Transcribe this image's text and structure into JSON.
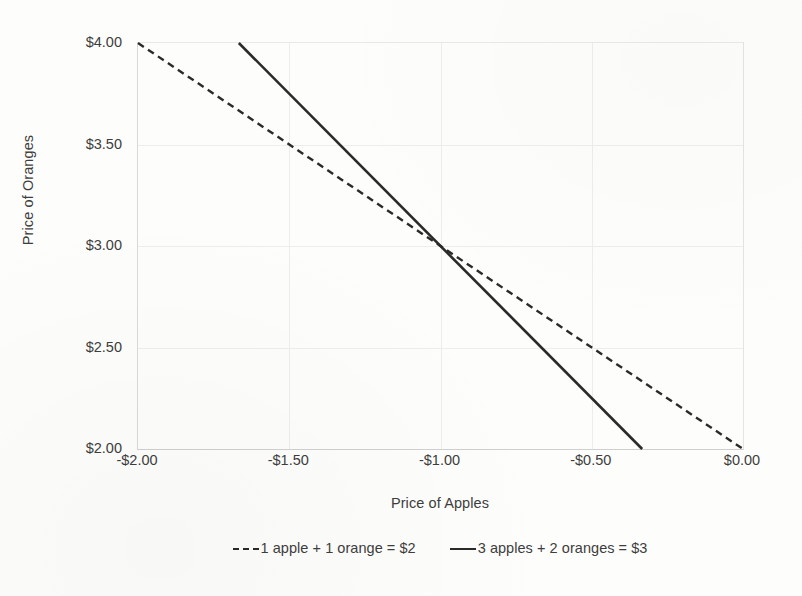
{
  "chart_data": {
    "type": "line",
    "title": "",
    "xlabel": "Price of Apples",
    "ylabel": "Price of Oranges",
    "xlim": [
      -2.0,
      0.0
    ],
    "ylim": [
      2.0,
      4.0
    ],
    "grid": true,
    "legend_position": "bottom",
    "x_ticks": [
      {
        "value": -2.0,
        "label": "-$2.00"
      },
      {
        "value": -1.5,
        "label": "-$1.50"
      },
      {
        "value": -1.0,
        "label": "-$1.00"
      },
      {
        "value": -0.5,
        "label": "-$0.50"
      },
      {
        "value": 0.0,
        "label": "$0.00"
      }
    ],
    "y_ticks": [
      {
        "value": 4.0,
        "label": "$4.00"
      },
      {
        "value": 3.5,
        "label": "$3.50"
      },
      {
        "value": 3.0,
        "label": "$3.00"
      },
      {
        "value": 2.5,
        "label": "$2.50"
      },
      {
        "value": 2.0,
        "label": "$2.00"
      }
    ],
    "series": [
      {
        "name": "1 apple + 1 orange = $2",
        "style": "dashed",
        "color": "#2a2a2a",
        "x": [
          -2.0,
          0.0
        ],
        "values": [
          4.0,
          2.0
        ]
      },
      {
        "name": "3 apples + 2 oranges = $3",
        "style": "solid",
        "color": "#2a2a2a",
        "x": [
          -1.6667,
          -0.3333
        ],
        "values": [
          4.0,
          2.0
        ]
      }
    ],
    "intersection": {
      "x": -1.0,
      "y": 3.0
    }
  },
  "legend": {
    "items": [
      {
        "label": "1 apple + 1 orange = $2",
        "style": "dashed"
      },
      {
        "label": "3 apples + 2 oranges = $3",
        "style": "solid"
      }
    ]
  },
  "colors": {
    "line": "#2a2a2a",
    "gridline": "#ededed",
    "text": "#3d3d3d",
    "background": "#fdfdfc"
  }
}
